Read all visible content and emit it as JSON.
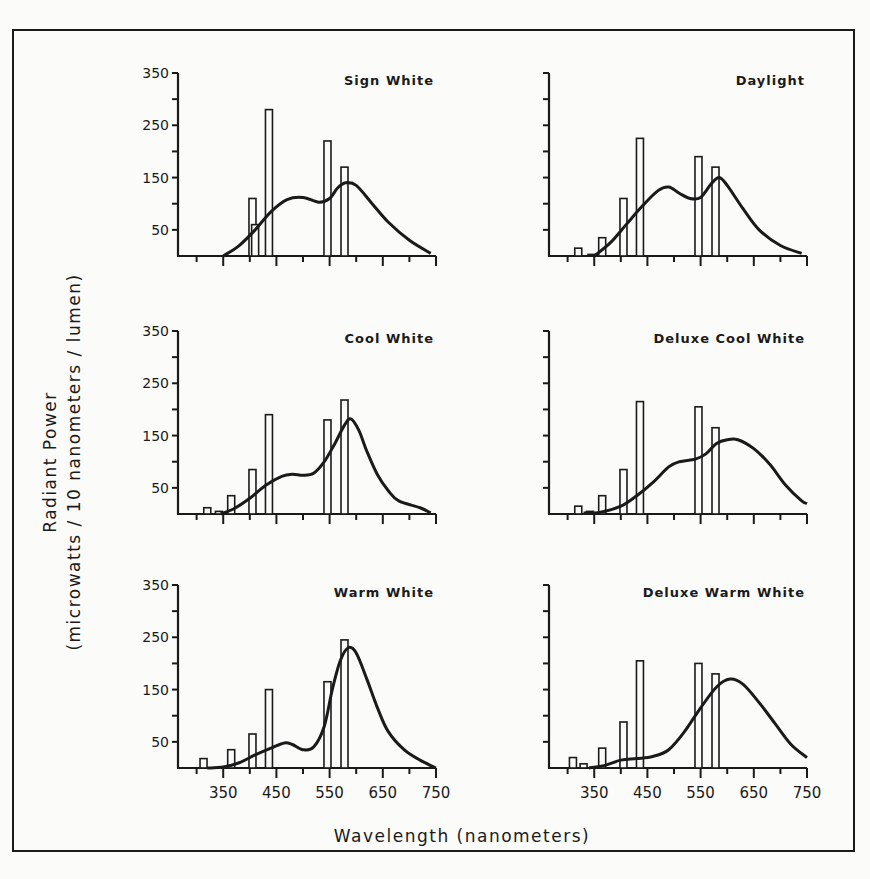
{
  "figure": {
    "ylabel_line1": "Radiant Power",
    "ylabel_line2": "(microwatts / 10 nanometers / lumen)",
    "xlabel": "Wavelength (nanometers)"
  },
  "chart_data": [
    {
      "type": "bar+line",
      "title": "Sign White",
      "xlabel": "Wavelength (nanometers)",
      "ylabel": "Radiant Power (microwatts / 10 nanometers / lumen)",
      "xlim": [
        265,
        750
      ],
      "ylim": [
        0,
        350
      ],
      "yticks": [
        50,
        150,
        250,
        350
      ],
      "xticks": [
        350,
        450,
        550,
        650,
        750
      ],
      "bars": [
        {
          "x": 405,
          "y": 110
        },
        {
          "x": 410,
          "y": 60
        },
        {
          "x": 436,
          "y": 280
        },
        {
          "x": 546,
          "y": 220
        },
        {
          "x": 578,
          "y": 170
        }
      ],
      "curve": [
        [
          350,
          0
        ],
        [
          380,
          20
        ],
        [
          410,
          50
        ],
        [
          440,
          85
        ],
        [
          470,
          108
        ],
        [
          500,
          112
        ],
        [
          530,
          103
        ],
        [
          550,
          110
        ],
        [
          565,
          130
        ],
        [
          580,
          140
        ],
        [
          600,
          135
        ],
        [
          630,
          100
        ],
        [
          660,
          65
        ],
        [
          700,
          30
        ],
        [
          740,
          5
        ]
      ]
    },
    {
      "type": "bar+line",
      "title": "Daylight",
      "xlim": [
        265,
        750
      ],
      "ylim": [
        0,
        350
      ],
      "bars": [
        {
          "x": 320,
          "y": 15
        },
        {
          "x": 345,
          "y": 3
        },
        {
          "x": 365,
          "y": 35
        },
        {
          "x": 405,
          "y": 110
        },
        {
          "x": 436,
          "y": 225
        },
        {
          "x": 546,
          "y": 190
        },
        {
          "x": 578,
          "y": 170
        }
      ],
      "curve": [
        [
          350,
          0
        ],
        [
          380,
          25
        ],
        [
          410,
          60
        ],
        [
          440,
          95
        ],
        [
          470,
          125
        ],
        [
          490,
          132
        ],
        [
          510,
          120
        ],
        [
          530,
          110
        ],
        [
          550,
          112
        ],
        [
          570,
          138
        ],
        [
          585,
          150
        ],
        [
          600,
          135
        ],
        [
          630,
          90
        ],
        [
          660,
          50
        ],
        [
          700,
          20
        ],
        [
          740,
          5
        ]
      ]
    },
    {
      "type": "bar+line",
      "title": "Cool White",
      "xlim": [
        265,
        750
      ],
      "ylim": [
        0,
        350
      ],
      "bars": [
        {
          "x": 320,
          "y": 12
        },
        {
          "x": 342,
          "y": 5
        },
        {
          "x": 365,
          "y": 35
        },
        {
          "x": 405,
          "y": 85
        },
        {
          "x": 436,
          "y": 190
        },
        {
          "x": 546,
          "y": 180
        },
        {
          "x": 578,
          "y": 218
        }
      ],
      "curve": [
        [
          345,
          0
        ],
        [
          370,
          10
        ],
        [
          400,
          30
        ],
        [
          430,
          55
        ],
        [
          460,
          72
        ],
        [
          480,
          76
        ],
        [
          500,
          74
        ],
        [
          520,
          78
        ],
        [
          540,
          100
        ],
        [
          560,
          135
        ],
        [
          578,
          170
        ],
        [
          590,
          182
        ],
        [
          605,
          160
        ],
        [
          620,
          120
        ],
        [
          640,
          75
        ],
        [
          660,
          45
        ],
        [
          680,
          25
        ],
        [
          720,
          12
        ],
        [
          740,
          2
        ]
      ]
    },
    {
      "type": "bar+line",
      "title": "Deluxe Cool White",
      "xlim": [
        265,
        750
      ],
      "ylim": [
        0,
        350
      ],
      "bars": [
        {
          "x": 320,
          "y": 15
        },
        {
          "x": 342,
          "y": 5
        },
        {
          "x": 365,
          "y": 35
        },
        {
          "x": 405,
          "y": 85
        },
        {
          "x": 436,
          "y": 215
        },
        {
          "x": 546,
          "y": 205
        },
        {
          "x": 578,
          "y": 165
        }
      ],
      "curve": [
        [
          330,
          2
        ],
        [
          360,
          3
        ],
        [
          400,
          15
        ],
        [
          430,
          35
        ],
        [
          460,
          60
        ],
        [
          490,
          90
        ],
        [
          510,
          100
        ],
        [
          540,
          105
        ],
        [
          560,
          115
        ],
        [
          580,
          135
        ],
        [
          600,
          142
        ],
        [
          620,
          142
        ],
        [
          650,
          125
        ],
        [
          680,
          95
        ],
        [
          710,
          55
        ],
        [
          740,
          25
        ],
        [
          750,
          20
        ]
      ]
    },
    {
      "type": "bar+line",
      "title": "Warm White",
      "xlim": [
        265,
        750
      ],
      "ylim": [
        0,
        350
      ],
      "bars": [
        {
          "x": 313,
          "y": 18
        },
        {
          "x": 365,
          "y": 35
        },
        {
          "x": 405,
          "y": 65
        },
        {
          "x": 436,
          "y": 150
        },
        {
          "x": 546,
          "y": 165
        },
        {
          "x": 578,
          "y": 245
        }
      ],
      "curve": [
        [
          320,
          0
        ],
        [
          350,
          2
        ],
        [
          380,
          10
        ],
        [
          410,
          25
        ],
        [
          440,
          38
        ],
        [
          465,
          48
        ],
        [
          480,
          45
        ],
        [
          500,
          35
        ],
        [
          520,
          40
        ],
        [
          540,
          80
        ],
        [
          555,
          150
        ],
        [
          570,
          205
        ],
        [
          585,
          230
        ],
        [
          600,
          220
        ],
        [
          620,
          170
        ],
        [
          640,
          115
        ],
        [
          660,
          70
        ],
        [
          690,
          35
        ],
        [
          720,
          15
        ],
        [
          750,
          0
        ]
      ]
    },
    {
      "type": "bar+line",
      "title": "Deluxe Warm White",
      "xlim": [
        265,
        750
      ],
      "ylim": [
        0,
        350
      ],
      "bars": [
        {
          "x": 310,
          "y": 20
        },
        {
          "x": 330,
          "y": 8
        },
        {
          "x": 365,
          "y": 38
        },
        {
          "x": 405,
          "y": 88
        },
        {
          "x": 436,
          "y": 205
        },
        {
          "x": 546,
          "y": 200
        },
        {
          "x": 578,
          "y": 180
        }
      ],
      "curve": [
        [
          340,
          0
        ],
        [
          370,
          5
        ],
        [
          400,
          15
        ],
        [
          430,
          18
        ],
        [
          460,
          22
        ],
        [
          490,
          35
        ],
        [
          520,
          70
        ],
        [
          550,
          115
        ],
        [
          580,
          155
        ],
        [
          605,
          170
        ],
        [
          630,
          160
        ],
        [
          660,
          125
        ],
        [
          690,
          85
        ],
        [
          720,
          45
        ],
        [
          750,
          20
        ]
      ]
    }
  ],
  "panel_labels": {
    "p0": "Sign White",
    "p1": "Daylight",
    "p2": "Cool White",
    "p3": "Deluxe Cool White",
    "p4": "Warm White",
    "p5": "Deluxe Warm White"
  },
  "ytick_labels": [
    "350",
    "250",
    "150",
    "50"
  ],
  "xtick_labels": [
    "350",
    "450",
    "550",
    "650",
    "750"
  ]
}
